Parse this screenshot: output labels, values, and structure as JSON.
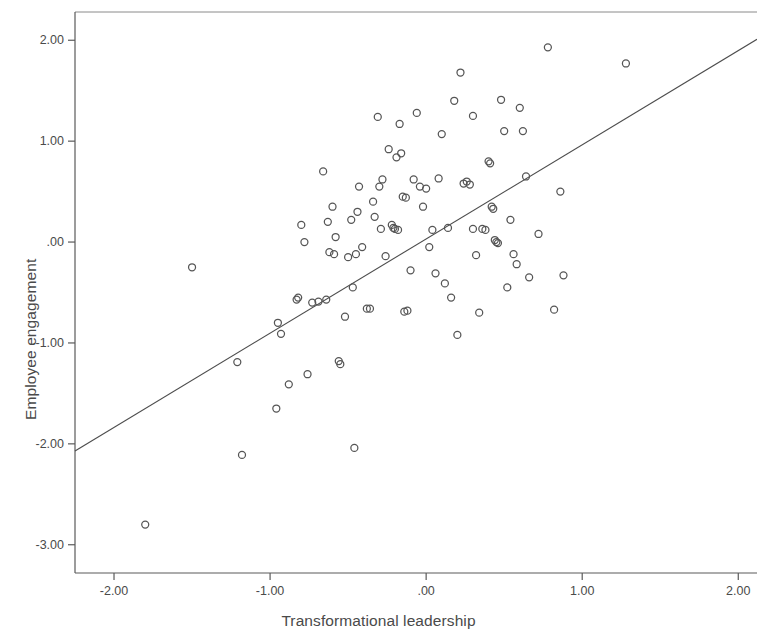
{
  "chart_data": {
    "type": "scatter",
    "title": "",
    "xlabel": "Transformational leadership",
    "ylabel": "Employee engagement",
    "xlim": [
      -2.25,
      2.12
    ],
    "ylim": [
      -3.28,
      2.28
    ],
    "xticks": [
      -2.0,
      -1.0,
      0.0,
      1.0,
      2.0
    ],
    "xticklabels": [
      "-2.00",
      "-1.00",
      ".00",
      "1.00",
      "2.00"
    ],
    "yticks": [
      2.0,
      1.0,
      0.0,
      -1.0,
      -2.0,
      -3.0
    ],
    "yticklabels": [
      "2.00",
      "1.00",
      ".00",
      "-1.00",
      "-2.00",
      "-3.00"
    ],
    "grid": false,
    "legend": null,
    "marker": "open-circle",
    "marker_color": "#555555",
    "marker_size": 7,
    "fit_line": {
      "type": "linear-regression",
      "color": "#4d4d4d",
      "x_start": -2.25,
      "y_start": -2.07,
      "x_end": 2.12,
      "y_end": 2.01
    },
    "n_points": 103,
    "points": [
      [
        -1.8,
        -2.8
      ],
      [
        -1.5,
        -0.25
      ],
      [
        -1.21,
        -1.19
      ],
      [
        -1.18,
        -2.11
      ],
      [
        -0.96,
        -1.65
      ],
      [
        -0.95,
        -0.8
      ],
      [
        -0.93,
        -0.91
      ],
      [
        -0.88,
        -1.41
      ],
      [
        -0.83,
        -0.57
      ],
      [
        -0.82,
        -0.55
      ],
      [
        -0.8,
        0.17
      ],
      [
        -0.78,
        0.0
      ],
      [
        -0.76,
        -1.31
      ],
      [
        -0.73,
        -0.6
      ],
      [
        -0.69,
        -0.59
      ],
      [
        -0.66,
        0.7
      ],
      [
        -0.64,
        -0.57
      ],
      [
        -0.63,
        0.2
      ],
      [
        -0.62,
        -0.1
      ],
      [
        -0.6,
        0.35
      ],
      [
        -0.59,
        -0.12
      ],
      [
        -0.58,
        0.05
      ],
      [
        -0.56,
        -1.18
      ],
      [
        -0.55,
        -1.21
      ],
      [
        -0.52,
        -0.74
      ],
      [
        -0.5,
        -0.15
      ],
      [
        -0.48,
        0.22
      ],
      [
        -0.47,
        -0.45
      ],
      [
        -0.46,
        -2.04
      ],
      [
        -0.45,
        -0.12
      ],
      [
        -0.44,
        0.3
      ],
      [
        -0.43,
        0.55
      ],
      [
        -0.41,
        -0.05
      ],
      [
        -0.38,
        -0.66
      ],
      [
        -0.36,
        -0.66
      ],
      [
        -0.34,
        0.4
      ],
      [
        -0.33,
        0.25
      ],
      [
        -0.31,
        1.24
      ],
      [
        -0.3,
        0.55
      ],
      [
        -0.29,
        0.13
      ],
      [
        -0.28,
        0.62
      ],
      [
        -0.26,
        -0.14
      ],
      [
        -0.24,
        0.92
      ],
      [
        -0.22,
        0.17
      ],
      [
        -0.21,
        0.14
      ],
      [
        -0.2,
        0.13
      ],
      [
        -0.19,
        0.84
      ],
      [
        -0.18,
        0.12
      ],
      [
        -0.17,
        1.17
      ],
      [
        -0.16,
        0.88
      ],
      [
        -0.15,
        0.45
      ],
      [
        -0.14,
        -0.69
      ],
      [
        -0.13,
        0.44
      ],
      [
        -0.12,
        -0.68
      ],
      [
        -0.1,
        -0.28
      ],
      [
        -0.08,
        0.62
      ],
      [
        -0.06,
        1.28
      ],
      [
        -0.04,
        0.55
      ],
      [
        -0.02,
        0.35
      ],
      [
        0.0,
        0.53
      ],
      [
        0.02,
        -0.05
      ],
      [
        0.04,
        0.12
      ],
      [
        0.06,
        -0.31
      ],
      [
        0.08,
        0.63
      ],
      [
        0.1,
        1.07
      ],
      [
        0.12,
        -0.41
      ],
      [
        0.14,
        0.14
      ],
      [
        0.16,
        -0.55
      ],
      [
        0.18,
        1.4
      ],
      [
        0.2,
        -0.92
      ],
      [
        0.22,
        1.68
      ],
      [
        0.24,
        0.58
      ],
      [
        0.26,
        0.6
      ],
      [
        0.28,
        0.57
      ],
      [
        0.3,
        1.25
      ],
      [
        0.32,
        -0.13
      ],
      [
        0.34,
        -0.7
      ],
      [
        0.36,
        0.13
      ],
      [
        0.38,
        0.12
      ],
      [
        0.4,
        0.8
      ],
      [
        0.41,
        0.78
      ],
      [
        0.42,
        0.35
      ],
      [
        0.43,
        0.33
      ],
      [
        0.44,
        0.02
      ],
      [
        0.45,
        0.0
      ],
      [
        0.46,
        -0.01
      ],
      [
        0.48,
        1.41
      ],
      [
        0.5,
        1.1
      ],
      [
        0.52,
        -0.45
      ],
      [
        0.54,
        0.22
      ],
      [
        0.56,
        -0.12
      ],
      [
        0.58,
        -0.22
      ],
      [
        0.6,
        1.33
      ],
      [
        0.62,
        1.1
      ],
      [
        0.64,
        0.65
      ],
      [
        0.66,
        -0.35
      ],
      [
        0.72,
        0.08
      ],
      [
        0.78,
        1.93
      ],
      [
        0.82,
        -0.67
      ],
      [
        0.86,
        0.5
      ],
      [
        0.88,
        -0.33
      ],
      [
        1.28,
        1.77
      ],
      [
        0.3,
        0.13
      ]
    ]
  },
  "axes": {
    "x_title": "Transformational leadership",
    "y_title": "Employee engagement"
  }
}
